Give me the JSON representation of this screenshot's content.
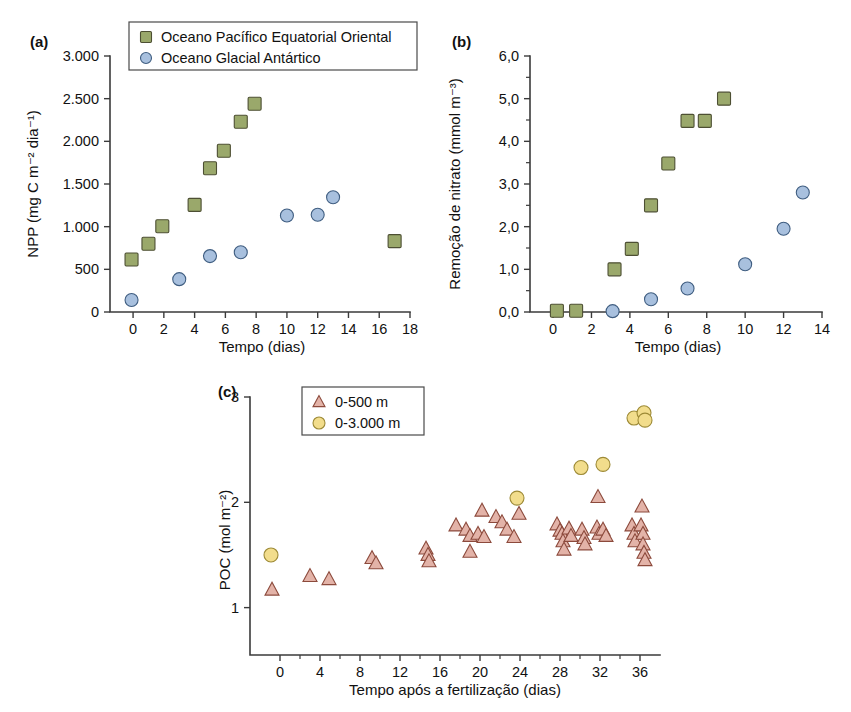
{
  "figure": {
    "background": "#ffffff",
    "colors": {
      "square_fill": "#9aa86b",
      "square_edge": "#4d4f33",
      "circle_fill": "#a8c0de",
      "circle_edge": "#3f5d80",
      "triangle_fill": "#e3b3a8",
      "triangle_edge": "#8c4a3c",
      "yellow_fill": "#f2dd8c",
      "yellow_edge": "#9d8a36",
      "axis": "#3b3b3b"
    }
  },
  "panels": {
    "a": {
      "label": "(a)",
      "legend": {
        "position": "top-right",
        "entries": [
          {
            "label": "Oceano Pacífico Equatorial Oriental",
            "marker": "square-marker"
          },
          {
            "label": "Oceano Glacial Antártico",
            "marker": "circle-marker"
          }
        ]
      }
    },
    "b": {
      "label": "(b)"
    },
    "c": {
      "label": "(c)",
      "legend": {
        "position": "top-left",
        "entries": [
          {
            "label": "0-500 m",
            "marker": "triangle-marker"
          },
          {
            "label": "0-3.000 m",
            "marker": "circle-marker"
          }
        ]
      }
    }
  },
  "chart_data": [
    {
      "panel": "a",
      "type": "scatter",
      "title": "",
      "xlabel": "Tempo (dias)",
      "ylabel": "NPP (mg C m⁻² dia⁻¹)",
      "xlim": [
        -1.5,
        18
      ],
      "ylim": [
        0,
        3000
      ],
      "xticks": [
        0,
        2,
        4,
        6,
        8,
        10,
        12,
        14,
        16,
        18
      ],
      "xticklabels": [
        "0",
        "2",
        "4",
        "6",
        "8",
        "10",
        "12",
        "14",
        "16",
        "18"
      ],
      "yticks": [
        0,
        500,
        1000,
        1500,
        2000,
        2500,
        3000
      ],
      "yticklabels": [
        "0",
        "500",
        "1.000",
        "1.500",
        "2.000",
        "2.500",
        "3.000"
      ],
      "grid": false,
      "legend": "upper right",
      "series": [
        {
          "name": "Oceano Pacífico Equatorial Oriental",
          "marker": "square",
          "color": "#9aa86b",
          "points": [
            {
              "x": -0.1,
              "y": 615
            },
            {
              "x": 1.0,
              "y": 800
            },
            {
              "x": 1.9,
              "y": 1005
            },
            {
              "x": 4.0,
              "y": 1255
            },
            {
              "x": 5.0,
              "y": 1685
            },
            {
              "x": 5.9,
              "y": 1890
            },
            {
              "x": 7.0,
              "y": 2230
            },
            {
              "x": 7.9,
              "y": 2440
            },
            {
              "x": 17.0,
              "y": 830
            }
          ]
        },
        {
          "name": "Oceano Glacial Antártico",
          "marker": "circle",
          "color": "#a8c0de",
          "points": [
            {
              "x": -0.1,
              "y": 140
            },
            {
              "x": 3.0,
              "y": 385
            },
            {
              "x": 5.0,
              "y": 655
            },
            {
              "x": 7.0,
              "y": 700
            },
            {
              "x": 10.0,
              "y": 1130
            },
            {
              "x": 12.0,
              "y": 1140
            },
            {
              "x": 13.0,
              "y": 1345
            }
          ]
        }
      ]
    },
    {
      "panel": "b",
      "type": "scatter",
      "title": "",
      "xlabel": "Tempo (dias)",
      "ylabel": "Remoção de nitrato (mmol m⁻³)",
      "xlim": [
        -1.2,
        14
      ],
      "ylim": [
        0,
        6
      ],
      "xticks": [
        0,
        2,
        4,
        6,
        8,
        10,
        12,
        14
      ],
      "xticklabels": [
        "0",
        "2",
        "4",
        "6",
        "8",
        "10",
        "12",
        "14"
      ],
      "yticks": [
        0,
        1,
        2,
        3,
        4,
        5,
        6
      ],
      "yticklabels": [
        "0,0",
        "1,0",
        "2,0",
        "3,0",
        "4,0",
        "5,0",
        "6,0"
      ],
      "yminorticks": [
        0.5,
        1.5,
        2.5,
        3.5,
        4.5,
        5.5
      ],
      "grid": false,
      "series": [
        {
          "name": "Oceano Pacífico Equatorial Oriental",
          "marker": "square",
          "color": "#9aa86b",
          "points": [
            {
              "x": 0.2,
              "y": 0.03
            },
            {
              "x": 1.2,
              "y": 0.03
            },
            {
              "x": 3.2,
              "y": 1.0
            },
            {
              "x": 4.1,
              "y": 1.48
            },
            {
              "x": 5.1,
              "y": 2.5
            },
            {
              "x": 6.0,
              "y": 3.48
            },
            {
              "x": 7.0,
              "y": 4.48
            },
            {
              "x": 7.9,
              "y": 4.48
            },
            {
              "x": 8.9,
              "y": 5.0
            }
          ]
        },
        {
          "name": "Oceano Glacial Antártico",
          "marker": "circle",
          "color": "#a8c0de",
          "points": [
            {
              "x": 3.1,
              "y": 0.02
            },
            {
              "x": 5.1,
              "y": 0.3
            },
            {
              "x": 7.0,
              "y": 0.55
            },
            {
              "x": 10.0,
              "y": 1.12
            },
            {
              "x": 12.0,
              "y": 1.95
            },
            {
              "x": 13.0,
              "y": 2.8
            }
          ]
        }
      ]
    },
    {
      "panel": "c",
      "type": "scatter",
      "title": "",
      "xlabel": "Tempo após a fertilização (dias)",
      "ylabel": "POC (mol m⁻²)",
      "xlim": [
        -3,
        38
      ],
      "ylim": [
        0.55,
        3
      ],
      "xticks": [
        0,
        4,
        8,
        12,
        16,
        20,
        24,
        28,
        32,
        36
      ],
      "xticklabels": [
        "0",
        "4",
        "8",
        "12",
        "16",
        "20",
        "24",
        "28",
        "32",
        "36"
      ],
      "xminortickstep": 2,
      "yticks": [
        1,
        2,
        3
      ],
      "yticklabels": [
        "1",
        "2",
        "3"
      ],
      "grid": false,
      "legend": "upper left",
      "series": [
        {
          "name": "0-500 m",
          "marker": "triangle",
          "color": "#e3b3a8",
          "points": [
            {
              "x": -0.8,
              "y": 1.17
            },
            {
              "x": 3.0,
              "y": 1.3
            },
            {
              "x": 4.9,
              "y": 1.27
            },
            {
              "x": 9.2,
              "y": 1.47
            },
            {
              "x": 9.6,
              "y": 1.42
            },
            {
              "x": 14.6,
              "y": 1.56
            },
            {
              "x": 14.8,
              "y": 1.5
            },
            {
              "x": 14.9,
              "y": 1.44
            },
            {
              "x": 17.6,
              "y": 1.78
            },
            {
              "x": 18.6,
              "y": 1.74
            },
            {
              "x": 19.0,
              "y": 1.68
            },
            {
              "x": 19.0,
              "y": 1.53
            },
            {
              "x": 19.8,
              "y": 1.7
            },
            {
              "x": 20.2,
              "y": 1.92
            },
            {
              "x": 20.4,
              "y": 1.67
            },
            {
              "x": 21.6,
              "y": 1.86
            },
            {
              "x": 22.2,
              "y": 1.81
            },
            {
              "x": 22.7,
              "y": 1.74
            },
            {
              "x": 23.4,
              "y": 1.67
            },
            {
              "x": 23.9,
              "y": 1.89
            },
            {
              "x": 27.7,
              "y": 1.79
            },
            {
              "x": 28.0,
              "y": 1.73
            },
            {
              "x": 28.2,
              "y": 1.7
            },
            {
              "x": 28.3,
              "y": 1.63
            },
            {
              "x": 28.4,
              "y": 1.55
            },
            {
              "x": 28.9,
              "y": 1.75
            },
            {
              "x": 29.1,
              "y": 1.68
            },
            {
              "x": 30.2,
              "y": 1.74
            },
            {
              "x": 30.4,
              "y": 1.66
            },
            {
              "x": 30.5,
              "y": 1.6
            },
            {
              "x": 31.8,
              "y": 2.05
            },
            {
              "x": 31.7,
              "y": 1.76
            },
            {
              "x": 31.9,
              "y": 1.7
            },
            {
              "x": 32.3,
              "y": 1.74
            },
            {
              "x": 32.6,
              "y": 1.68
            },
            {
              "x": 35.2,
              "y": 1.78
            },
            {
              "x": 35.4,
              "y": 1.7
            },
            {
              "x": 35.5,
              "y": 1.63
            },
            {
              "x": 36.2,
              "y": 1.96
            },
            {
              "x": 36.1,
              "y": 1.78
            },
            {
              "x": 36.3,
              "y": 1.7
            },
            {
              "x": 36.3,
              "y": 1.6
            },
            {
              "x": 36.4,
              "y": 1.52
            },
            {
              "x": 36.5,
              "y": 1.45
            }
          ]
        },
        {
          "name": "0-3.000 m",
          "marker": "circle",
          "color": "#f2dd8c",
          "points": [
            {
              "x": -0.9,
              "y": 1.5
            },
            {
              "x": 23.7,
              "y": 2.04
            },
            {
              "x": 30.1,
              "y": 2.33
            },
            {
              "x": 32.3,
              "y": 2.36
            },
            {
              "x": 35.4,
              "y": 2.8
            },
            {
              "x": 36.4,
              "y": 2.85
            },
            {
              "x": 36.5,
              "y": 2.78
            }
          ]
        }
      ]
    }
  ]
}
